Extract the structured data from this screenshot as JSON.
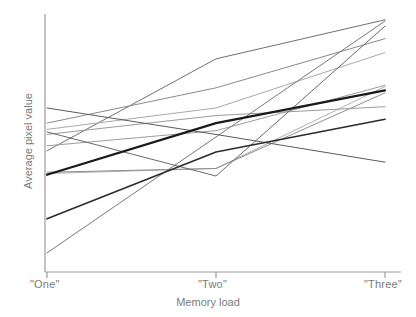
{
  "figure": {
    "background": "#ffffff",
    "axis_color": "#9a9a9a",
    "text_color": "#7a7a7a"
  },
  "axes": {
    "x_title": "Memory load",
    "y_title": "Average pixel value",
    "x_ticks": [
      "\"One\"",
      "\"Two\"",
      "\"Three\""
    ]
  },
  "chart_data": {
    "type": "line",
    "title": "",
    "xlabel": "Memory load",
    "ylabel": "Average pixel value",
    "categories": [
      "\"One\"",
      "\"Two\"",
      "\"Three\""
    ],
    "x": [
      0,
      1,
      2
    ],
    "xlim": [
      0,
      2
    ],
    "ylim": [
      0,
      100
    ],
    "grid": false,
    "legend": "none",
    "y_tick_labels": [],
    "note": "Spaghetti plot: individual subject lines in shades of grey plus a thick dark mean line.",
    "series": [
      {
        "name": "subject-1",
        "values": [
          46.5,
          83.0,
          98.5
        ],
        "color": "#707070",
        "width": 1.0
      },
      {
        "name": "subject-2",
        "values": [
          57.5,
          71.5,
          91.0
        ],
        "color": "#8a8a8a",
        "width": 1.0
      },
      {
        "name": "subject-3",
        "values": [
          55.0,
          63.5,
          85.5
        ],
        "color": "#a8a8a8",
        "width": 1.0
      },
      {
        "name": "subject-4",
        "values": [
          48.5,
          54.5,
          72.5
        ],
        "color": "#9c9c9c",
        "width": 1.0
      },
      {
        "name": "subject-5",
        "values": [
          37.5,
          39.5,
          72.0
        ],
        "color": "#b0b0b0",
        "width": 1.0
      },
      {
        "name": "subject-6",
        "values": [
          38.0,
          39.5,
          69.5
        ],
        "color": "#8e8e8e",
        "width": 1.0
      },
      {
        "name": "subject-7",
        "values": [
          53.0,
          60.5,
          64.0
        ],
        "color": "#9a9a9a",
        "width": 1.0
      },
      {
        "name": "subject-8",
        "values": [
          6.0,
          52.0,
          98.0
        ],
        "color": "#787878",
        "width": 1.0
      },
      {
        "name": "subject-9",
        "values": [
          54.0,
          36.5,
          96.0
        ],
        "color": "#6a6a6a",
        "width": 1.0
      },
      {
        "name": "subject-10",
        "values": [
          63.5,
          53.0,
          42.0
        ],
        "color": "#5a5a5a",
        "width": 1.0
      },
      {
        "name": "subject-11",
        "values": [
          19.5,
          46.0,
          59.0
        ],
        "color": "#2b2b2b",
        "width": 1.6
      },
      {
        "name": "mean",
        "values": [
          37.0,
          57.5,
          70.5
        ],
        "color": "#1a1a1a",
        "width": 2.2
      }
    ]
  }
}
